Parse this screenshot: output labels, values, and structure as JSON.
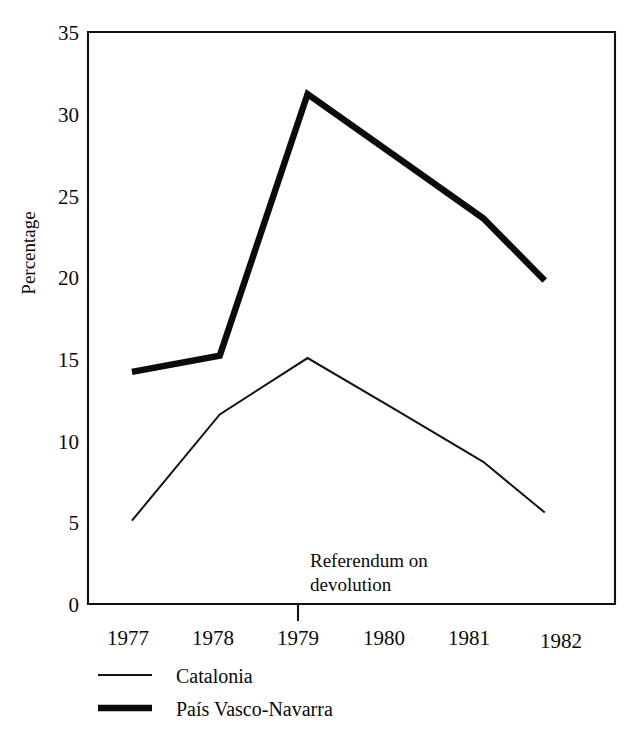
{
  "chart_data": {
    "type": "line",
    "title": "",
    "subtitle": "",
    "xlabel": "",
    "ylabel": "Percentage",
    "x": [
      1977,
      1978,
      1979,
      1980,
      1981,
      1982
    ],
    "categories": [
      "1977",
      "1978",
      "1979",
      "1980",
      "1981",
      "1982"
    ],
    "xlim": [
      1976.5,
      1982.5
    ],
    "ylim": [
      0,
      35
    ],
    "yticks": [
      0,
      5,
      10,
      15,
      20,
      25,
      30,
      35
    ],
    "ytick_labels": [
      "0",
      "5",
      "10",
      "15",
      "20",
      "25",
      "30",
      "35"
    ],
    "xtick_labels": [
      "1977",
      "1978",
      "1979",
      "1980",
      "1981",
      "1982"
    ],
    "grid": false,
    "legend_position": "below-axes-left",
    "series": [
      {
        "name": "Catalonia",
        "style": "thin",
        "x": [
          1977,
          1978,
          1979,
          1980,
          1981,
          1981.7
        ],
        "values": [
          5.1,
          11.6,
          15.05,
          11.9,
          8.7,
          5.6
        ]
      },
      {
        "name": "País Vasco-Navarra",
        "style": "thick",
        "x": [
          1977,
          1978,
          1979,
          1980,
          1981,
          1981.7
        ],
        "values": [
          14.2,
          15.2,
          31.2,
          27.4,
          23.6,
          19.8
        ]
      }
    ],
    "annotations": [
      {
        "label_lines": [
          "Referendum on",
          "devolution"
        ],
        "at_x": 1979,
        "marker": "x-axis-tick"
      }
    ]
  },
  "axes": {
    "y_title": "Percentage",
    "y_tick_0": "0",
    "y_tick_1": "5",
    "y_tick_2": "10",
    "y_tick_3": "15",
    "y_tick_4": "20",
    "y_tick_5": "25",
    "y_tick_6": "30",
    "y_tick_7": "35",
    "x_tick_0": "1977",
    "x_tick_1": "1978",
    "x_tick_2": "1979",
    "x_tick_3": "1980",
    "x_tick_4": "1981",
    "x_tick_5": "1982"
  },
  "annotation": {
    "line1": "Referendum on",
    "line2": "devolution"
  },
  "legend": {
    "entry_0_label": "Catalonia",
    "entry_1_label": "País Vasco-Navarra"
  },
  "colors": {
    "ink": "#0b0b0b",
    "background": "#ffffff"
  }
}
